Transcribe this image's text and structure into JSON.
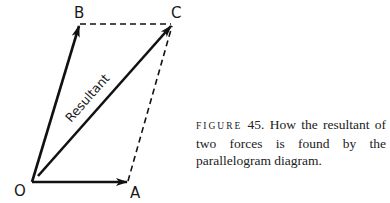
{
  "diagram": {
    "points": {
      "O": {
        "label": "O"
      },
      "A": {
        "label": "A"
      },
      "B": {
        "label": "B"
      },
      "C": {
        "label": "C"
      }
    },
    "vectors": [
      {
        "from": "O",
        "to": "A",
        "style": "solid",
        "arrow": true
      },
      {
        "from": "O",
        "to": "B",
        "style": "solid",
        "arrow": true
      },
      {
        "from": "O",
        "to": "C",
        "style": "solid",
        "arrow": true,
        "label": "Resultant"
      }
    ],
    "construction_lines": [
      {
        "from": "B",
        "to": "C",
        "style": "dashed"
      },
      {
        "from": "A",
        "to": "C",
        "style": "dashed"
      }
    ],
    "resultant_label": "Resultant",
    "stroke_color": "#111111"
  },
  "caption": {
    "figure_label": "Figure",
    "figure_number": "45.",
    "text": "How the resultant of two forces is found by the parallelogram diagram."
  }
}
